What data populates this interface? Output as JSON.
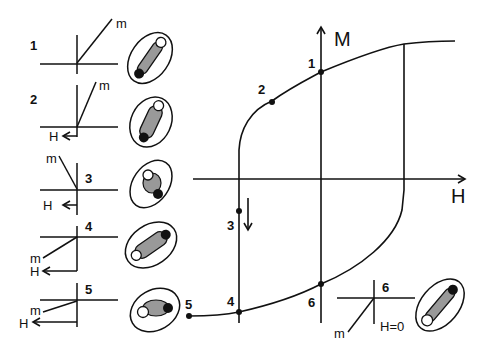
{
  "diagram": {
    "axes": {
      "x_label": "H",
      "y_label": "M"
    },
    "curve_points": [
      {
        "id": "1",
        "label": "1"
      },
      {
        "id": "2",
        "label": "2"
      },
      {
        "id": "3",
        "label": "3"
      },
      {
        "id": "4",
        "label": "4"
      },
      {
        "id": "5",
        "label": "5"
      },
      {
        "id": "6",
        "label": "6"
      }
    ],
    "states": [
      {
        "label": "1",
        "m_label": "m",
        "h_label": ""
      },
      {
        "label": "2",
        "m_label": "m",
        "h_label": "H"
      },
      {
        "label": "3",
        "m_label": "m",
        "h_label": "H"
      },
      {
        "label": "4",
        "m_label": "m",
        "h_label": "H"
      },
      {
        "label": "5",
        "m_label": "m",
        "h_label": "H"
      },
      {
        "label": "6",
        "m_label": "m",
        "h_label": "H=0"
      }
    ],
    "colors": {
      "line": "#111111",
      "fill": "#999999",
      "background": "#ffffff"
    }
  }
}
